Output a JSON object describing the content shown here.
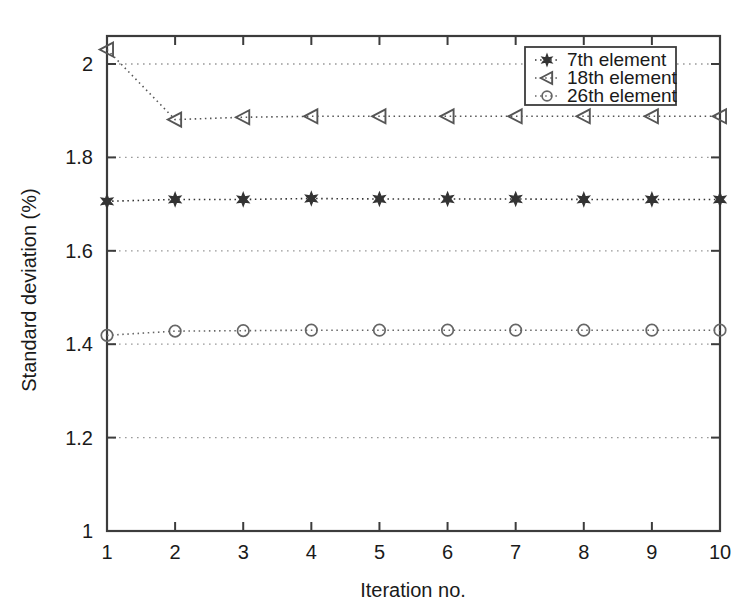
{
  "chart_data": {
    "type": "line",
    "title": "",
    "xlabel": "Iteration no.",
    "ylabel": "Standard deviation (%)",
    "x": [
      1,
      2,
      3,
      4,
      5,
      6,
      7,
      8,
      9,
      10
    ],
    "xlim": [
      1,
      10
    ],
    "ylim": [
      1,
      2.06
    ],
    "xticks": [
      "1",
      "2",
      "3",
      "4",
      "5",
      "6",
      "7",
      "8",
      "9",
      "10"
    ],
    "yticks": [
      "1",
      "1.2",
      "1.4",
      "1.6",
      "1.8",
      "2"
    ],
    "ytick_values": [
      1,
      1.2,
      1.4,
      1.6,
      1.8,
      2
    ],
    "grid": "horizontal-dotted",
    "legend_position": "top-right",
    "line_style": "dotted",
    "series": [
      {
        "name": "7th element",
        "marker": "hexagram",
        "marker_fill": "solid",
        "color": "#333333",
        "values": [
          1.706,
          1.71,
          1.71,
          1.712,
          1.711,
          1.711,
          1.711,
          1.71,
          1.71,
          1.71
        ]
      },
      {
        "name": "18th element",
        "marker": "triangle-left",
        "marker_fill": "open",
        "color": "#555555",
        "values": [
          2.031,
          1.881,
          1.886,
          1.888,
          1.888,
          1.888,
          1.888,
          1.888,
          1.888,
          1.888
        ]
      },
      {
        "name": "26th element",
        "marker": "circle",
        "marker_fill": "open",
        "color": "#666666",
        "values": [
          1.419,
          1.428,
          1.429,
          1.43,
          1.43,
          1.43,
          1.43,
          1.43,
          1.43,
          1.43
        ]
      }
    ]
  },
  "legend": {
    "entries": [
      {
        "label": "7th element"
      },
      {
        "label": "18th element"
      },
      {
        "label": "26th element"
      }
    ]
  },
  "axes": {
    "x_title": "Iteration no.",
    "y_title": "Standard deviation (%)",
    "x_tick_labels": [
      "1",
      "2",
      "3",
      "4",
      "5",
      "6",
      "7",
      "8",
      "9",
      "10"
    ],
    "y_tick_labels": [
      "1",
      "1.2",
      "1.4",
      "1.6",
      "1.8",
      "2"
    ]
  },
  "colors": {
    "axis": "#3c3c3c",
    "grid": "#9a9a9a",
    "series_1": "#333333",
    "series_2": "#555555",
    "series_3": "#666666",
    "background": "#ffffff"
  }
}
